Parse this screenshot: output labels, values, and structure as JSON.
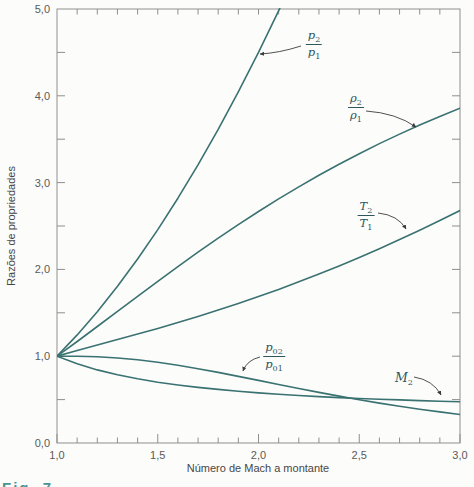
{
  "figure": {
    "caption_fragment": "Fig. 7",
    "colors": {
      "curve": "#3a7272",
      "axis": "#8f8f8f",
      "tick_label": "#5a5a5a",
      "axis_title": "#474747",
      "annotation": "#2e565e",
      "arrow": "#3d3d3d"
    }
  },
  "chart_data": {
    "type": "line",
    "title": "",
    "xlabel": "Número de Mach a montante",
    "ylabel": "Razões de propriedades",
    "xlim": [
      1.0,
      3.0
    ],
    "ylim": [
      0.0,
      5.0
    ],
    "grid": false,
    "x_major_ticks": [
      1.0,
      1.5,
      2.0,
      2.5,
      3.0
    ],
    "x_tick_labels": [
      "1,0",
      "1,5",
      "2,0",
      "2,5",
      "3,0"
    ],
    "x_minor_step": 0.1,
    "y_major_ticks": [
      0,
      1,
      2,
      3,
      4,
      5
    ],
    "y_tick_labels": [
      "0,0",
      "1,0",
      "2,0",
      "3,0",
      "4,0",
      "5,0"
    ],
    "y_minor_step": 0.5,
    "x": [
      1.0,
      1.1,
      1.2,
      1.3,
      1.4,
      1.5,
      1.6,
      1.7,
      1.8,
      1.9,
      2.0,
      2.1,
      2.2,
      2.3,
      2.4,
      2.5,
      2.6,
      2.7,
      2.8,
      2.9,
      3.0
    ],
    "series": [
      {
        "key": "p2p1",
        "name": "p2/p1",
        "values": [
          1.0,
          1.245,
          1.513,
          1.805,
          2.12,
          2.458,
          2.82,
          3.205,
          3.613,
          4.045,
          4.5,
          4.978,
          5.48,
          6.005,
          6.553,
          7.125,
          7.72,
          8.338,
          8.98,
          9.645,
          10.333
        ]
      },
      {
        "key": "rho2rho1",
        "name": "rho2/rho1",
        "values": [
          1.0,
          1.169,
          1.342,
          1.516,
          1.69,
          1.862,
          2.032,
          2.198,
          2.359,
          2.516,
          2.667,
          2.812,
          2.951,
          3.085,
          3.212,
          3.333,
          3.449,
          3.559,
          3.664,
          3.763,
          3.857
        ]
      },
      {
        "key": "T2T1",
        "name": "T2/T1",
        "values": [
          1.0,
          1.065,
          1.128,
          1.191,
          1.255,
          1.32,
          1.388,
          1.458,
          1.532,
          1.608,
          1.688,
          1.77,
          1.857,
          1.947,
          2.04,
          2.138,
          2.238,
          2.343,
          2.451,
          2.563,
          2.679
        ]
      },
      {
        "key": "p02p01",
        "name": "p02/p01",
        "values": [
          1.0,
          0.999,
          0.993,
          0.979,
          0.958,
          0.93,
          0.895,
          0.856,
          0.813,
          0.767,
          0.721,
          0.674,
          0.628,
          0.583,
          0.54,
          0.499,
          0.46,
          0.424,
          0.389,
          0.358,
          0.328
        ]
      },
      {
        "key": "M2",
        "name": "M2",
        "values": [
          1.0,
          0.912,
          0.842,
          0.786,
          0.74,
          0.701,
          0.668,
          0.641,
          0.617,
          0.596,
          0.577,
          0.561,
          0.547,
          0.534,
          0.523,
          0.513,
          0.504,
          0.496,
          0.488,
          0.481,
          0.475
        ]
      }
    ],
    "annotations": [
      {
        "key": "p2p1",
        "num": "p",
        "num_sub": "2",
        "den": "p",
        "den_sub": "1",
        "label_x": 314,
        "label_y": 44,
        "arrow": {
          "x1": 301,
          "y1": 46,
          "cx": 279,
          "cy": 53,
          "x2": 260,
          "y2": 54
        }
      },
      {
        "key": "rho2rho1",
        "num": "ρ",
        "num_sub": "2",
        "den": "ρ",
        "den_sub": "1",
        "label_x": 356,
        "label_y": 107,
        "arrow": {
          "x1": 366,
          "y1": 111,
          "cx": 396,
          "cy": 113,
          "x2": 416,
          "y2": 127
        }
      },
      {
        "key": "T2T1",
        "num": "T",
        "num_sub": "2",
        "den": "T",
        "den_sub": "1",
        "label_x": 366,
        "label_y": 215,
        "arrow": {
          "x1": 378,
          "y1": 213,
          "cx": 398,
          "cy": 215,
          "x2": 406,
          "y2": 229
        }
      },
      {
        "key": "p02p01",
        "num": "p",
        "num_sub": "02",
        "den": "p",
        "den_sub": "01",
        "label_x": 274,
        "label_y": 356,
        "arrow": {
          "x1": 260,
          "y1": 357,
          "cx": 247,
          "cy": 360,
          "x2": 243,
          "y2": 371
        }
      },
      {
        "key": "M2",
        "num": "M",
        "num_sub": "2",
        "den": "",
        "den_sub": "",
        "label_x": 404,
        "label_y": 378,
        "arrow": {
          "x1": 414,
          "y1": 377,
          "cx": 433,
          "cy": 380,
          "x2": 441,
          "y2": 395
        }
      }
    ]
  }
}
